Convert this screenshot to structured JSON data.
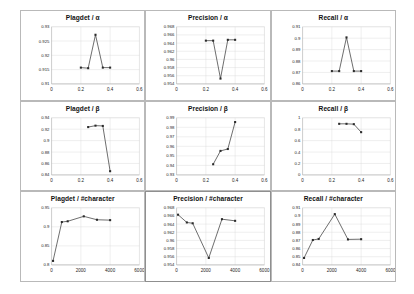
{
  "figure": {
    "layout": "3x3 grid of line charts",
    "background_color": "#ffffff",
    "panel_border_color": "#b9b9b9",
    "series_color": "#2b2b2b",
    "gridline_color": "#d6d6d6"
  },
  "chart_data": [
    {
      "type": "line",
      "title": "Plagdet / α",
      "xlabel": "",
      "ylabel": "",
      "xlim": [
        0,
        0.6
      ],
      "ylim": [
        0.91,
        0.93
      ],
      "xticks": [
        "0",
        "0.2",
        "0.4",
        "0.6"
      ],
      "xtick_values": [
        0,
        0.2,
        0.4,
        0.6
      ],
      "yticks": [
        "0.93",
        "0.925",
        "0.92",
        "0.915",
        "0.91"
      ],
      "ytick_values": [
        0.93,
        0.925,
        0.92,
        0.915,
        0.91
      ],
      "grid": true,
      "legend": "none",
      "x": [
        0.2,
        0.25,
        0.3,
        0.35,
        0.4
      ],
      "values": [
        0.9157,
        0.9155,
        0.9272,
        0.9157,
        0.9157
      ]
    },
    {
      "type": "line",
      "title": "Precision / α",
      "xlabel": "",
      "ylabel": "",
      "xlim": [
        0,
        0.6
      ],
      "ylim": [
        0.954,
        0.968
      ],
      "xticks": [
        "0",
        "0.2",
        "0.4",
        "0.6"
      ],
      "xtick_values": [
        0,
        0.2,
        0.4,
        0.6
      ],
      "yticks": [
        "0.968",
        "0.966",
        "0.964",
        "0.962",
        "0.96",
        "0.958",
        "0.956",
        "0.954"
      ],
      "ytick_values": [
        0.968,
        0.966,
        0.964,
        0.962,
        0.96,
        0.958,
        0.956,
        0.954
      ],
      "grid": true,
      "legend": "none",
      "x": [
        0.2,
        0.25,
        0.3,
        0.35,
        0.4
      ],
      "values": [
        0.9646,
        0.9646,
        0.9553,
        0.9648,
        0.9648
      ]
    },
    {
      "type": "line",
      "title": "Recall / α",
      "xlabel": "",
      "ylabel": "",
      "xlim": [
        0,
        0.6
      ],
      "ylim": [
        0.86,
        0.91
      ],
      "xticks": [
        "0",
        "0.2",
        "0.4",
        "0.6"
      ],
      "xtick_values": [
        0,
        0.2,
        0.4,
        0.6
      ],
      "yticks": [
        "0.91",
        "0.9",
        "0.89",
        "0.88",
        "0.87",
        "0.86"
      ],
      "ytick_values": [
        0.91,
        0.9,
        0.89,
        0.88,
        0.87,
        0.86
      ],
      "grid": true,
      "legend": "none",
      "x": [
        0.2,
        0.25,
        0.3,
        0.35,
        0.4
      ],
      "values": [
        0.8712,
        0.8712,
        0.9007,
        0.8712,
        0.8712
      ]
    },
    {
      "type": "line",
      "title": "Plagdet / β",
      "xlabel": "",
      "ylabel": "",
      "xlim": [
        0,
        0.6
      ],
      "ylim": [
        0.84,
        0.94
      ],
      "xticks": [
        "0",
        "0.2",
        "0.4",
        "0.6"
      ],
      "xtick_values": [
        0,
        0.2,
        0.4,
        0.6
      ],
      "yticks": [
        "0.94",
        "0.92",
        "0.9",
        "0.88",
        "0.86",
        "0.84"
      ],
      "ytick_values": [
        0.94,
        0.92,
        0.9,
        0.88,
        0.86,
        0.84
      ],
      "grid": true,
      "legend": "none",
      "x": [
        0.25,
        0.3,
        0.35,
        0.4
      ],
      "values": [
        0.9237,
        0.9262,
        0.9257,
        0.8465
      ]
    },
    {
      "type": "line",
      "title": "Precision / β",
      "xlabel": "",
      "ylabel": "",
      "xlim": [
        0,
        0.6
      ],
      "ylim": [
        0.93,
        0.99
      ],
      "xticks": [
        "0",
        "0.2",
        "0.4",
        "0.6"
      ],
      "xtick_values": [
        0,
        0.2,
        0.4,
        0.6
      ],
      "yticks": [
        "0.99",
        "0.98",
        "0.97",
        "0.96",
        "0.95",
        "0.94",
        "0.93"
      ],
      "ytick_values": [
        0.99,
        0.98,
        0.97,
        0.96,
        0.95,
        0.94,
        0.93
      ],
      "grid": true,
      "legend": "none",
      "x": [
        0.25,
        0.3,
        0.35,
        0.4
      ],
      "values": [
        0.9412,
        0.9552,
        0.9572,
        0.9855
      ]
    },
    {
      "type": "line",
      "title": "Recall / β",
      "xlabel": "",
      "ylabel": "",
      "xlim": [
        0,
        0.6
      ],
      "ylim": [
        0,
        1
      ],
      "xticks": [
        "0",
        "0.2",
        "0.4",
        "0.6"
      ],
      "xtick_values": [
        0,
        0.2,
        0.4,
        0.6
      ],
      "yticks": [
        "1",
        "0.8",
        "0.6",
        "0.4",
        "0.2",
        "0"
      ],
      "ytick_values": [
        1,
        0.8,
        0.6,
        0.4,
        0.2,
        0
      ],
      "grid": true,
      "legend": "none",
      "x": [
        0.25,
        0.3,
        0.35,
        0.4
      ],
      "values": [
        0.894,
        0.894,
        0.888,
        0.748
      ]
    },
    {
      "type": "line",
      "title": "Plagdet / #character",
      "xlabel": "",
      "ylabel": "",
      "xlim": [
        0,
        6000
      ],
      "ylim": [
        0.8,
        0.95
      ],
      "xticks": [
        "0",
        "2000",
        "4000",
        "6000"
      ],
      "xtick_values": [
        0,
        2000,
        4000,
        6000
      ],
      "yticks": [
        "0.95",
        "0.9",
        "0.85",
        "0.8"
      ],
      "ytick_values": [
        0.95,
        0.9,
        0.85,
        0.8
      ],
      "grid": true,
      "legend": "none",
      "x": [
        100,
        700,
        1100,
        2200,
        3100,
        4000
      ],
      "values": [
        0.8105,
        0.9125,
        0.9145,
        0.9275,
        0.9185,
        0.9175
      ]
    },
    {
      "type": "line",
      "title": "Precision / #character",
      "xlabel": "",
      "ylabel": "",
      "xlim": [
        0,
        6000
      ],
      "ylim": [
        0.954,
        0.968
      ],
      "xticks": [
        "0",
        "2000",
        "4000",
        "6000"
      ],
      "xtick_values": [
        0,
        2000,
        4000,
        6000
      ],
      "yticks": [
        "0.968",
        "0.966",
        "0.964",
        "0.962",
        "0.96",
        "0.958",
        "0.956",
        "0.954"
      ],
      "ytick_values": [
        0.968,
        0.966,
        0.964,
        0.962,
        0.96,
        0.958,
        0.956,
        0.954
      ],
      "grid": true,
      "legend": "none",
      "x": [
        100,
        700,
        1100,
        2200,
        3100,
        4000
      ],
      "values": [
        0.9663,
        0.9644,
        0.9642,
        0.9557,
        0.9652,
        0.9648
      ]
    },
    {
      "type": "line",
      "title": "Recall / #character",
      "xlabel": "",
      "ylabel": "",
      "xlim": [
        0,
        6000
      ],
      "ylim": [
        0.84,
        0.91
      ],
      "xticks": [
        "0",
        "2000",
        "4000",
        "6000"
      ],
      "xtick_values": [
        0,
        2000,
        4000,
        6000
      ],
      "yticks": [
        "0.91",
        "0.9",
        "0.89",
        "0.88",
        "0.87",
        "0.86",
        "0.85",
        "0.84"
      ],
      "ytick_values": [
        0.91,
        0.9,
        0.89,
        0.88,
        0.87,
        0.86,
        0.85,
        0.84
      ],
      "grid": true,
      "legend": "none",
      "x": [
        100,
        700,
        1100,
        2200,
        3100,
        4000
      ],
      "values": [
        0.8485,
        0.8705,
        0.8718,
        0.9022,
        0.8712,
        0.8715
      ]
    }
  ]
}
